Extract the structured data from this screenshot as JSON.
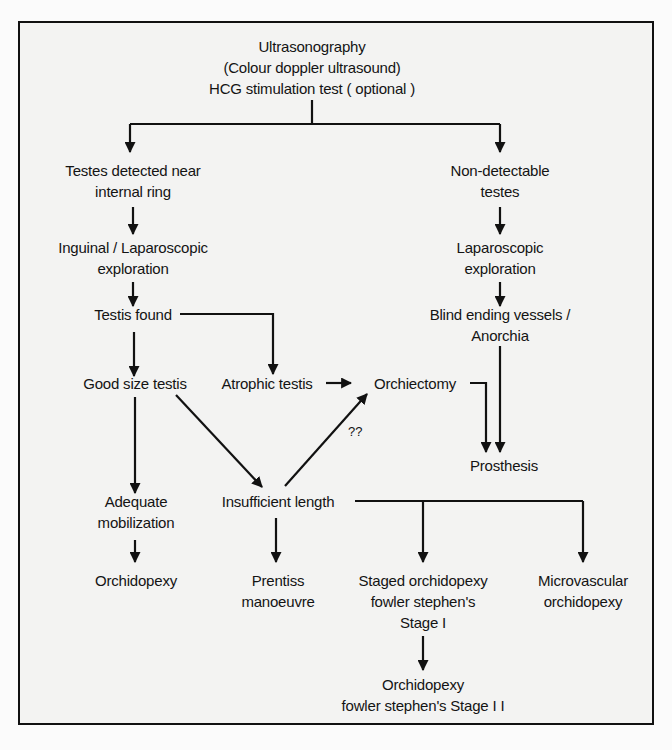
{
  "diagram": {
    "type": "flowchart",
    "nodes": {
      "root": {
        "lines": [
          "Ultrasonography",
          "(Colour doppler ultrasound)",
          "HCG stimulation test ( optional )"
        ]
      },
      "detected": {
        "lines": [
          "Testes detected near",
          "internal ring"
        ]
      },
      "nondetect": {
        "lines": [
          "Non-detectable",
          "testes"
        ]
      },
      "inguinal": {
        "lines": [
          "Inguinal / Laparoscopic",
          "exploration"
        ]
      },
      "lapexp": {
        "lines": [
          "Laparoscopic",
          "exploration"
        ]
      },
      "found": {
        "lines": [
          "Testis found"
        ]
      },
      "blind": {
        "lines": [
          "Blind ending vessels /",
          "Anorchia"
        ]
      },
      "goodsize": {
        "lines": [
          "Good size testis"
        ]
      },
      "atrophic": {
        "lines": [
          "Atrophic testis"
        ]
      },
      "orchiectomy": {
        "lines": [
          "Orchiectomy"
        ]
      },
      "prosthesis": {
        "lines": [
          "Prosthesis"
        ]
      },
      "adequate": {
        "lines": [
          "Adequate",
          "mobilization"
        ]
      },
      "insufficient": {
        "lines": [
          "Insufficient length"
        ]
      },
      "orchidopexy": {
        "lines": [
          "Orchidopexy"
        ]
      },
      "prentiss": {
        "lines": [
          "Prentiss",
          "manoeuvre"
        ]
      },
      "staged": {
        "lines": [
          "Staged orchidopexy",
          "fowler stephen's",
          "Stage I"
        ]
      },
      "microvascular": {
        "lines": [
          "Microvascular",
          "orchidopexy"
        ]
      },
      "stage2": {
        "lines": [
          "Orchidopexy",
          "fowler stephen's Stage I I"
        ]
      }
    },
    "edge_label": "??",
    "edges": [
      [
        "root",
        "detected"
      ],
      [
        "root",
        "nondetect"
      ],
      [
        "detected",
        "inguinal"
      ],
      [
        "inguinal",
        "found"
      ],
      [
        "found",
        "goodsize"
      ],
      [
        "found",
        "atrophic"
      ],
      [
        "nondetect",
        "lapexp"
      ],
      [
        "lapexp",
        "blind"
      ],
      [
        "blind",
        "prosthesis"
      ],
      [
        "atrophic",
        "orchiectomy"
      ],
      [
        "orchiectomy",
        "prosthesis"
      ],
      [
        "goodsize",
        "adequate"
      ],
      [
        "goodsize",
        "insufficient"
      ],
      [
        "insufficient",
        "orchiectomy",
        "??"
      ],
      [
        "adequate",
        "orchidopexy"
      ],
      [
        "insufficient",
        "prentiss"
      ],
      [
        "insufficient",
        "staged"
      ],
      [
        "insufficient",
        "microvascular"
      ],
      [
        "staged",
        "stage2"
      ]
    ]
  }
}
